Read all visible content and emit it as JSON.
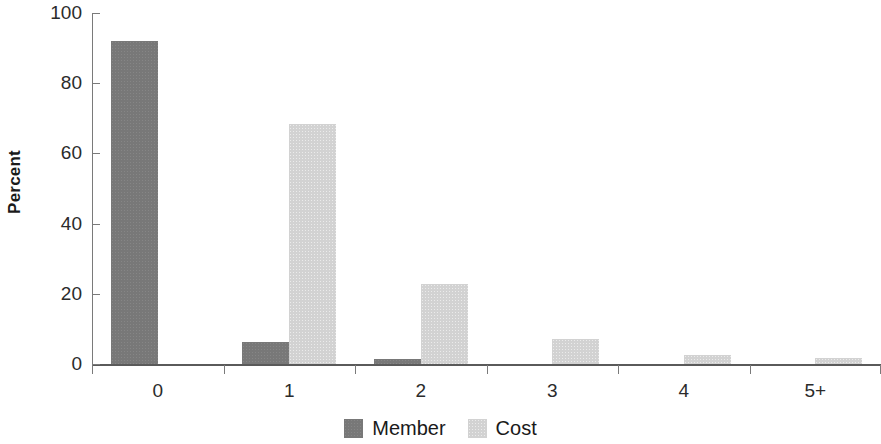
{
  "chart_data": {
    "type": "bar",
    "title": "",
    "subtitle": "",
    "xlabel": "",
    "ylabel": "Percent",
    "categories": [
      "0",
      "1",
      "2",
      "3",
      "4",
      "5+"
    ],
    "series": [
      {
        "name": "Member",
        "color": "#787878",
        "values": [
          92,
          6.3,
          1.4,
          0,
          0,
          0
        ]
      },
      {
        "name": "Cost",
        "color": "#d2d2d2",
        "values": [
          0,
          68.5,
          22.7,
          7,
          2.5,
          1.6
        ]
      }
    ],
    "ylim": [
      0,
      100
    ],
    "y_ticks": [
      0,
      20,
      40,
      60,
      80,
      100
    ],
    "y_tick_labels": [
      "0",
      "20",
      "40",
      "60",
      "80",
      "100"
    ],
    "grid": false,
    "legend_position": "bottom-center",
    "legend_entries": [
      "Member",
      "Cost"
    ]
  }
}
